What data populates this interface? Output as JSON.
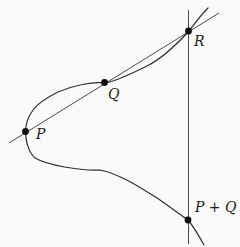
{
  "figure": {
    "background_color": "#fafaf8",
    "curve_color": "#2f2f2f",
    "line_color": "#4a4a4a",
    "dot_color": "#0d0d0d",
    "label_color": "#1c1c1c",
    "dot_radius": "3.4",
    "curve_path": "M208,8 C201,15 195,23 189,31 C178,43 161,59 147,66 C133,73 117,81 105,83 C92,81.5 73,85.5 58,92 C47,97.5 38,103 33,110 C28,117 25,124 26,132 C25,140 29,153 35,158 C47,165 80,171 100,170 C120,174 141,188 160,200 C170,207 179,214 188,220 C194,227 199,236 204,245",
    "secant_line_path": "M9,143 L219,13",
    "vertical_line_path": "M188.5,10 L188.5,244",
    "points": {
      "P": {
        "label": "P",
        "x": "25.5",
        "y": "131.5",
        "label_x": "36",
        "label_y": "139"
      },
      "Q": {
        "label": "Q",
        "x": "104.5",
        "y": "82.5",
        "label_x": "108",
        "label_y": "99"
      },
      "R": {
        "label": "R",
        "x": "188.5",
        "y": "31",
        "label_x": "194",
        "label_y": "46"
      },
      "PplusQ": {
        "label": "P + Q",
        "x": "188",
        "y": "220",
        "label_x": "195",
        "label_y": "212"
      }
    }
  }
}
